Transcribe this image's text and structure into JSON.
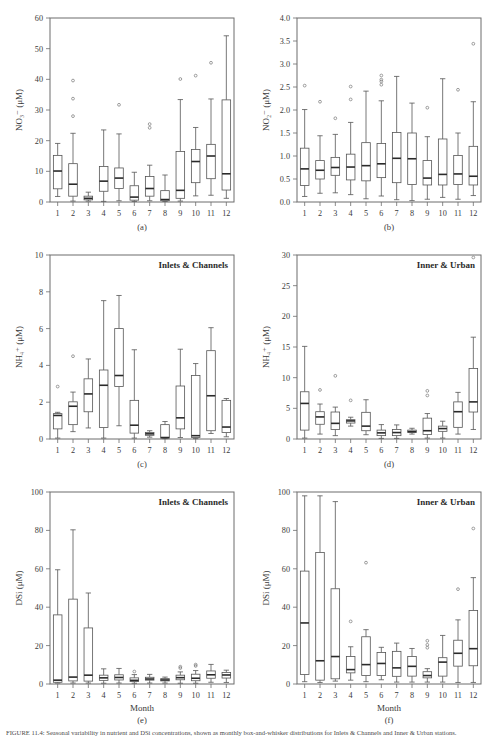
{
  "figure": {
    "width": 497,
    "height": 738,
    "caption": "FIGURE 11.4: Seasonal variability in nutrient and DSi concentrations, shown as monthly box-and-whisker distributions for Inlets & Channels and Inner & Urban stations."
  },
  "axis_common": {
    "xlabel": "Month",
    "xticks": [
      "1",
      "2",
      "3",
      "4",
      "5",
      "6",
      "7",
      "8",
      "9",
      "10",
      "11",
      "12"
    ]
  },
  "chart_data": [
    {
      "type": "box",
      "panel": "a",
      "panel_label": "(a)",
      "group_title": "",
      "title": "",
      "ylabel": "NO₃⁻ (μM)",
      "xlabel": "",
      "ylim": [
        0,
        60
      ],
      "yticks": [
        0,
        10,
        20,
        30,
        40,
        50,
        60
      ],
      "ytick_labels": [
        "0",
        "10",
        "20",
        "30",
        "40",
        "50",
        "60"
      ],
      "categories": [
        "1",
        "2",
        "3",
        "4",
        "5",
        "6",
        "7",
        "8",
        "9",
        "10",
        "11",
        "12"
      ],
      "boxes": [
        {
          "x": "1",
          "whisker_low": 1.8,
          "q1": 4.3,
          "median": 10.1,
          "q3": 15.2,
          "whisker_high": 19.1,
          "outliers": []
        },
        {
          "x": "2",
          "whisker_low": 0.3,
          "q1": 1.9,
          "median": 5.8,
          "q3": 12.5,
          "whisker_high": 22.4,
          "outliers": [
            39.6,
            33.7,
            28.0
          ]
        },
        {
          "x": "3",
          "whisker_low": 0.3,
          "q1": 0.7,
          "median": 1.2,
          "q3": 1.9,
          "whisker_high": 3.2,
          "outliers": []
        },
        {
          "x": "4",
          "whisker_low": 0.2,
          "q1": 3.5,
          "median": 6.8,
          "q3": 11.6,
          "whisker_high": 23.5,
          "outliers": []
        },
        {
          "x": "5",
          "whisker_low": 0.4,
          "q1": 4.4,
          "median": 7.8,
          "q3": 11.1,
          "whisker_high": 22.2,
          "outliers": [
            31.7
          ]
        },
        {
          "x": "6",
          "whisker_low": 0.2,
          "q1": 0.6,
          "median": 1.6,
          "q3": 5.3,
          "whisker_high": 9.7,
          "outliers": []
        },
        {
          "x": "7",
          "whisker_low": 0.4,
          "q1": 1.9,
          "median": 4.4,
          "q3": 8.3,
          "whisker_high": 12.0,
          "outliers": [
            25.4,
            24.2
          ]
        },
        {
          "x": "8",
          "whisker_low": 0.2,
          "q1": 0.4,
          "median": 0.8,
          "q3": 3.7,
          "whisker_high": 8.8,
          "outliers": []
        },
        {
          "x": "9",
          "whisker_low": 0.3,
          "q1": 1.2,
          "median": 3.8,
          "q3": 16.5,
          "whisker_high": 33.4,
          "outliers": [
            40.1
          ]
        },
        {
          "x": "10",
          "whisker_low": 2.0,
          "q1": 6.3,
          "median": 13.2,
          "q3": 17.1,
          "whisker_high": 24.3,
          "outliers": [
            41.2
          ]
        },
        {
          "x": "11",
          "whisker_low": 2.2,
          "q1": 7.6,
          "median": 15.0,
          "q3": 18.8,
          "whisker_high": 33.6,
          "outliers": [
            45.4
          ]
        },
        {
          "x": "12",
          "whisker_low": 1.2,
          "q1": 3.9,
          "median": 9.2,
          "q3": 33.3,
          "whisker_high": 54.2,
          "outliers": []
        }
      ]
    },
    {
      "type": "box",
      "panel": "b",
      "panel_label": "(b)",
      "group_title": "",
      "title": "",
      "ylabel": "NO₂⁻ (μM)",
      "xlabel": "",
      "ylim": [
        0,
        4.0
      ],
      "yticks": [
        0,
        0.5,
        1.0,
        1.5,
        2.0,
        2.5,
        3.0,
        3.5,
        4.0
      ],
      "ytick_labels": [
        "0.0",
        "0.5",
        "1.0",
        "1.5",
        "2.0",
        "2.5",
        "3.0",
        "3.5",
        "4.0"
      ],
      "categories": [
        "1",
        "2",
        "3",
        "4",
        "5",
        "6",
        "7",
        "8",
        "9",
        "10",
        "11",
        "12"
      ],
      "boxes": [
        {
          "x": "1",
          "whisker_low": 0.12,
          "q1": 0.36,
          "median": 0.72,
          "q3": 1.17,
          "whisker_high": 2.01,
          "outliers": [
            2.53
          ]
        },
        {
          "x": "2",
          "whisker_low": 0.19,
          "q1": 0.5,
          "median": 0.69,
          "q3": 0.9,
          "whisker_high": 1.44,
          "outliers": [
            2.18
          ]
        },
        {
          "x": "3",
          "whisker_low": 0.2,
          "q1": 0.58,
          "median": 0.75,
          "q3": 0.97,
          "whisker_high": 1.47,
          "outliers": [
            1.82
          ]
        },
        {
          "x": "4",
          "whisker_low": 0.16,
          "q1": 0.48,
          "median": 0.76,
          "q3": 1.04,
          "whisker_high": 1.73,
          "outliers": [
            2.51,
            2.23
          ]
        },
        {
          "x": "5",
          "whisker_low": 0.07,
          "q1": 0.46,
          "median": 0.79,
          "q3": 1.29,
          "whisker_high": 2.41,
          "outliers": []
        },
        {
          "x": "6",
          "whisker_low": 0.13,
          "q1": 0.53,
          "median": 0.83,
          "q3": 1.27,
          "whisker_high": 2.2,
          "outliers": [
            2.75,
            2.66,
            2.62,
            2.55
          ]
        },
        {
          "x": "7",
          "whisker_low": 0.05,
          "q1": 0.42,
          "median": 0.95,
          "q3": 1.51,
          "whisker_high": 2.73,
          "outliers": []
        },
        {
          "x": "8",
          "whisker_low": 0.03,
          "q1": 0.38,
          "median": 0.94,
          "q3": 1.5,
          "whisker_high": 2.15,
          "outliers": []
        },
        {
          "x": "9",
          "whisker_low": 0.06,
          "q1": 0.37,
          "median": 0.52,
          "q3": 0.9,
          "whisker_high": 1.42,
          "outliers": [
            2.05
          ]
        },
        {
          "x": "10",
          "whisker_low": 0.1,
          "q1": 0.37,
          "median": 0.6,
          "q3": 1.37,
          "whisker_high": 2.68,
          "outliers": []
        },
        {
          "x": "11",
          "whisker_low": 0.06,
          "q1": 0.38,
          "median": 0.61,
          "q3": 1.01,
          "whisker_high": 1.5,
          "outliers": [
            2.44
          ]
        },
        {
          "x": "12",
          "whisker_low": 0.14,
          "q1": 0.37,
          "median": 0.56,
          "q3": 1.21,
          "whisker_high": 2.18,
          "outliers": [
            3.44
          ]
        }
      ]
    },
    {
      "type": "box",
      "panel": "c",
      "panel_label": "(c)",
      "group_title": "Inlets & Channels",
      "title": "Inlets & Channels",
      "ylabel": "NH₄⁺ (μM)",
      "xlabel": "",
      "ylim": [
        0,
        10
      ],
      "yticks": [
        0,
        2,
        4,
        6,
        8,
        10
      ],
      "ytick_labels": [
        "0",
        "2",
        "4",
        "6",
        "8",
        "10"
      ],
      "categories": [
        "1",
        "2",
        "3",
        "4",
        "5",
        "6",
        "7",
        "8",
        "9",
        "10",
        "11",
        "12"
      ],
      "boxes": [
        {
          "x": "1",
          "whisker_low": 0.05,
          "q1": 0.55,
          "median": 1.28,
          "q3": 1.38,
          "whisker_high": 1.45,
          "outliers": [
            2.85
          ]
        },
        {
          "x": "2",
          "whisker_low": 0.4,
          "q1": 0.78,
          "median": 1.78,
          "q3": 2.02,
          "whisker_high": 2.55,
          "outliers": [
            4.5
          ]
        },
        {
          "x": "3",
          "whisker_low": 0.6,
          "q1": 1.48,
          "median": 2.45,
          "q3": 3.27,
          "whisker_high": 4.35,
          "outliers": []
        },
        {
          "x": "4",
          "whisker_low": 0.05,
          "q1": 0.62,
          "median": 2.92,
          "q3": 3.75,
          "whisker_high": 7.52,
          "outliers": []
        },
        {
          "x": "5",
          "whisker_low": 0.72,
          "q1": 2.85,
          "median": 3.45,
          "q3": 6.0,
          "whisker_high": 7.8,
          "outliers": []
        },
        {
          "x": "6",
          "whisker_low": 0.05,
          "q1": 0.32,
          "median": 0.75,
          "q3": 2.1,
          "whisker_high": 4.85,
          "outliers": []
        },
        {
          "x": "7",
          "whisker_low": 0.1,
          "q1": 0.2,
          "median": 0.28,
          "q3": 0.35,
          "whisker_high": 0.45,
          "outliers": []
        },
        {
          "x": "8",
          "whisker_low": 0.02,
          "q1": 0.05,
          "median": 0.08,
          "q3": 0.78,
          "whisker_high": 0.95,
          "outliers": []
        },
        {
          "x": "9",
          "whisker_low": 0.08,
          "q1": 0.55,
          "median": 1.15,
          "q3": 2.88,
          "whisker_high": 4.88,
          "outliers": []
        },
        {
          "x": "10",
          "whisker_low": 0.02,
          "q1": 0.08,
          "median": 0.18,
          "q3": 3.45,
          "whisker_high": 4.1,
          "outliers": []
        },
        {
          "x": "11",
          "whisker_low": 0.3,
          "q1": 0.45,
          "median": 2.35,
          "q3": 4.8,
          "whisker_high": 6.05,
          "outliers": []
        },
        {
          "x": "12",
          "whisker_low": 0.12,
          "q1": 0.35,
          "median": 0.65,
          "q3": 2.1,
          "whisker_high": 2.2,
          "outliers": []
        }
      ]
    },
    {
      "type": "box",
      "panel": "d",
      "panel_label": "(d)",
      "group_title": "Inner & Urban",
      "title": "Inner & Urban",
      "ylabel": "NH₄⁺ (μM)",
      "xlabel": "",
      "ylim": [
        0,
        30
      ],
      "yticks": [
        0,
        5,
        10,
        15,
        20,
        25,
        30
      ],
      "ytick_labels": [
        "0",
        "5",
        "10",
        "15",
        "20",
        "25",
        "30"
      ],
      "categories": [
        "1",
        "2",
        "3",
        "4",
        "5",
        "6",
        "7",
        "8",
        "9",
        "10",
        "11",
        "12"
      ],
      "boxes": [
        {
          "x": "1",
          "whisker_low": 0.15,
          "q1": 1.45,
          "median": 5.8,
          "q3": 7.7,
          "whisker_high": 15.1,
          "outliers": []
        },
        {
          "x": "2",
          "whisker_low": 0.8,
          "q1": 2.4,
          "median": 3.6,
          "q3": 4.45,
          "whisker_high": 5.7,
          "outliers": [
            8.0
          ]
        },
        {
          "x": "3",
          "whisker_low": 0.55,
          "q1": 1.55,
          "median": 2.55,
          "q3": 4.4,
          "whisker_high": 5.2,
          "outliers": [
            10.3
          ]
        },
        {
          "x": "4",
          "whisker_low": 2.1,
          "q1": 2.6,
          "median": 2.95,
          "q3": 3.15,
          "whisker_high": 3.55,
          "outliers": [
            6.3
          ]
        },
        {
          "x": "5",
          "whisker_low": 0.7,
          "q1": 1.35,
          "median": 2.1,
          "q3": 4.35,
          "whisker_high": 6.4,
          "outliers": []
        },
        {
          "x": "6",
          "whisker_low": 0.1,
          "q1": 0.55,
          "median": 1.0,
          "q3": 1.45,
          "whisker_high": 2.35,
          "outliers": []
        },
        {
          "x": "7",
          "whisker_low": 0.1,
          "q1": 0.55,
          "median": 1.05,
          "q3": 1.55,
          "whisker_high": 2.3,
          "outliers": []
        },
        {
          "x": "8",
          "whisker_low": 0.8,
          "q1": 1.05,
          "median": 1.2,
          "q3": 1.45,
          "whisker_high": 1.75,
          "outliers": []
        },
        {
          "x": "9",
          "whisker_low": 0.15,
          "q1": 0.75,
          "median": 1.35,
          "q3": 3.4,
          "whisker_high": 4.15,
          "outliers": [
            7.85,
            7.1
          ]
        },
        {
          "x": "10",
          "whisker_low": 0.15,
          "q1": 1.25,
          "median": 1.7,
          "q3": 2.1,
          "whisker_high": 2.9,
          "outliers": []
        },
        {
          "x": "11",
          "whisker_low": 0.8,
          "q1": 1.9,
          "median": 4.45,
          "q3": 6.05,
          "whisker_high": 7.6,
          "outliers": []
        },
        {
          "x": "12",
          "whisker_low": 1.55,
          "q1": 4.4,
          "median": 6.05,
          "q3": 11.5,
          "whisker_high": 16.6,
          "outliers": [
            29.6
          ]
        }
      ]
    },
    {
      "type": "box",
      "panel": "e",
      "panel_label": "(e)",
      "group_title": "Inlets & Channels",
      "title": "Inlets & Channels",
      "ylabel": "DSi (μM)",
      "xlabel": "Month",
      "ylim": [
        0,
        100
      ],
      "yticks": [
        0,
        20,
        40,
        60,
        80,
        100
      ],
      "ytick_labels": [
        "0",
        "20",
        "40",
        "60",
        "80",
        "100"
      ],
      "categories": [
        "1",
        "2",
        "3",
        "4",
        "5",
        "6",
        "7",
        "8",
        "9",
        "10",
        "11",
        "12"
      ],
      "boxes": [
        {
          "x": "1",
          "whisker_low": 0.5,
          "q1": 0.9,
          "median": 2.0,
          "q3": 36.0,
          "whisker_high": 59.5,
          "outliers": []
        },
        {
          "x": "2",
          "whisker_low": 0.5,
          "q1": 1.6,
          "median": 3.6,
          "q3": 44.2,
          "whisker_high": 80.3,
          "outliers": []
        },
        {
          "x": "3",
          "whisker_low": 0.5,
          "q1": 1.5,
          "median": 4.6,
          "q3": 29.2,
          "whisker_high": 47.4,
          "outliers": []
        },
        {
          "x": "4",
          "whisker_low": 0.4,
          "q1": 1.9,
          "median": 3.2,
          "q3": 4.6,
          "whisker_high": 7.9,
          "outliers": []
        },
        {
          "x": "5",
          "whisker_low": 0.5,
          "q1": 2.1,
          "median": 3.4,
          "q3": 4.8,
          "whisker_high": 8.1,
          "outliers": []
        },
        {
          "x": "6",
          "whisker_low": 0.4,
          "q1": 1.3,
          "median": 1.9,
          "q3": 3.2,
          "whisker_high": 4.9,
          "outliers": [
            6.5
          ]
        },
        {
          "x": "7",
          "whisker_low": 0.5,
          "q1": 2.0,
          "median": 2.6,
          "q3": 3.5,
          "whisker_high": 5.0,
          "outliers": []
        },
        {
          "x": "8",
          "whisker_low": 0.5,
          "q1": 1.6,
          "median": 2.1,
          "q3": 2.8,
          "whisker_high": 3.6,
          "outliers": []
        },
        {
          "x": "9",
          "whisker_low": 0.4,
          "q1": 2.2,
          "median": 3.3,
          "q3": 4.6,
          "whisker_high": 6.3,
          "outliers": [
            9.0,
            8.3
          ]
        },
        {
          "x": "10",
          "whisker_low": 0.4,
          "q1": 1.7,
          "median": 3.0,
          "q3": 5.1,
          "whisker_high": 7.0,
          "outliers": [
            10.1,
            9.4
          ]
        },
        {
          "x": "11",
          "whisker_low": 0.9,
          "q1": 3.0,
          "median": 4.8,
          "q3": 6.8,
          "whisker_high": 10.2,
          "outliers": []
        },
        {
          "x": "12",
          "whisker_low": 0.8,
          "q1": 3.1,
          "median": 4.7,
          "q3": 6.0,
          "whisker_high": 7.2,
          "outliers": []
        }
      ]
    },
    {
      "type": "box",
      "panel": "f",
      "panel_label": "(f)",
      "group_title": "Inner & Urban",
      "title": "Inner & Urban",
      "ylabel": "DSi (μM)",
      "xlabel": "Month",
      "ylim": [
        0,
        100
      ],
      "yticks": [
        0,
        20,
        40,
        60,
        80,
        100
      ],
      "ytick_labels": [
        "0",
        "20",
        "40",
        "60",
        "80",
        "100"
      ],
      "categories": [
        "1",
        "2",
        "3",
        "4",
        "5",
        "6",
        "7",
        "8",
        "9",
        "10",
        "11",
        "12"
      ],
      "boxes": [
        {
          "x": "1",
          "whisker_low": 1.2,
          "q1": 5.0,
          "median": 31.8,
          "q3": 58.8,
          "whisker_high": 98.0,
          "outliers": []
        },
        {
          "x": "2",
          "whisker_low": 0.8,
          "q1": 2.0,
          "median": 12.1,
          "q3": 68.5,
          "whisker_high": 98.0,
          "outliers": []
        },
        {
          "x": "3",
          "whisker_low": 1.5,
          "q1": 2.7,
          "median": 14.3,
          "q3": 49.6,
          "whisker_high": 95.0,
          "outliers": []
        },
        {
          "x": "4",
          "whisker_low": 2.0,
          "q1": 5.8,
          "median": 7.5,
          "q3": 14.3,
          "whisker_high": 19.4,
          "outliers": [
            32.6
          ]
        },
        {
          "x": "5",
          "whisker_low": 1.2,
          "q1": 4.4,
          "median": 10.1,
          "q3": 24.6,
          "whisker_high": 28.3,
          "outliers": [
            63.2
          ]
        },
        {
          "x": "6",
          "whisker_low": 2.2,
          "q1": 4.4,
          "median": 10.7,
          "q3": 16.4,
          "whisker_high": 19.1,
          "outliers": []
        },
        {
          "x": "7",
          "whisker_low": 1.0,
          "q1": 4.0,
          "median": 8.4,
          "q3": 17.0,
          "whisker_high": 21.3,
          "outliers": []
        },
        {
          "x": "8",
          "whisker_low": 1.0,
          "q1": 4.1,
          "median": 9.2,
          "q3": 14.3,
          "whisker_high": 18.5,
          "outliers": []
        },
        {
          "x": "9",
          "whisker_low": 1.0,
          "q1": 3.2,
          "median": 4.4,
          "q3": 6.4,
          "whisker_high": 8.0,
          "outliers": [
            22.5,
            20.4,
            18.9
          ]
        },
        {
          "x": "10",
          "whisker_low": 1.0,
          "q1": 4.1,
          "median": 11.4,
          "q3": 13.7,
          "whisker_high": 25.3,
          "outliers": []
        },
        {
          "x": "11",
          "whisker_low": 0.8,
          "q1": 9.3,
          "median": 16.0,
          "q3": 22.8,
          "whisker_high": 33.4,
          "outliers": [
            49.4
          ]
        },
        {
          "x": "12",
          "whisker_low": 0.8,
          "q1": 9.5,
          "median": 18.4,
          "q3": 38.3,
          "whisker_high": 55.4,
          "outliers": [
            81.0
          ]
        }
      ]
    }
  ]
}
